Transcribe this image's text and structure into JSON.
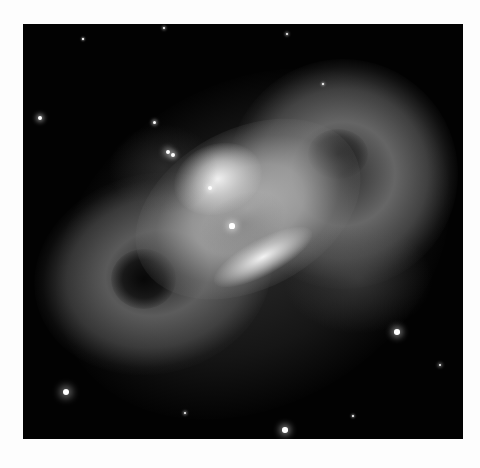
{
  "image": {
    "subject": "planetary nebula",
    "description": "Grayscale telescope image of a bipolar planetary nebula with two cloudy lobes, a bright central star, and scattered background stars on a black sky",
    "colors": {
      "page_background": "#fdfdfd",
      "sky": "#020202",
      "nebula_bright": "#e8e8e8",
      "nebula_mid": "#8a8a8a"
    },
    "frame": {
      "x": 23,
      "y": 24,
      "width": 440,
      "height": 415
    },
    "stars": [
      {
        "x": 17,
        "y": 94,
        "r": 2.2
      },
      {
        "x": 131,
        "y": 98,
        "r": 1.5
      },
      {
        "x": 145,
        "y": 128,
        "r": 2.4
      },
      {
        "x": 150,
        "y": 131,
        "r": 2.0
      },
      {
        "x": 209,
        "y": 202,
        "r": 2.6
      },
      {
        "x": 374,
        "y": 308,
        "r": 2.8
      },
      {
        "x": 43,
        "y": 368,
        "r": 3.2
      },
      {
        "x": 262,
        "y": 406,
        "r": 2.8
      },
      {
        "x": 162,
        "y": 389,
        "r": 1.2
      },
      {
        "x": 417,
        "y": 341,
        "r": 1.4
      },
      {
        "x": 264,
        "y": 10,
        "r": 1.1
      },
      {
        "x": 141,
        "y": 4,
        "r": 1.1
      },
      {
        "x": 187,
        "y": 164,
        "r": 2.0
      },
      {
        "x": 300,
        "y": 60,
        "r": 0.9
      },
      {
        "x": 330,
        "y": 392,
        "r": 0.9
      },
      {
        "x": 60,
        "y": 15,
        "r": 0.8
      }
    ]
  }
}
